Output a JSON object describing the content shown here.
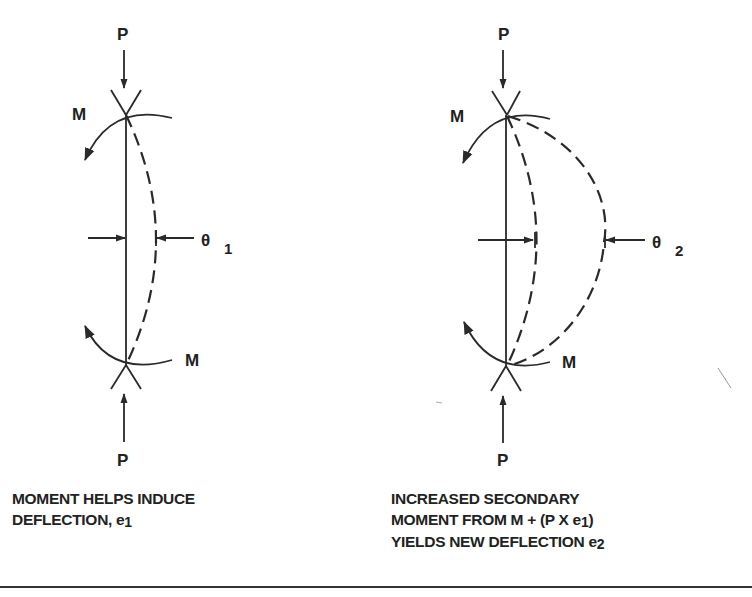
{
  "figure": {
    "left_panel": {
      "load_top_label": "P",
      "load_bottom_label": "P",
      "moment_top_label": "M",
      "moment_bottom_label": "M",
      "deflection_symbol": "θ",
      "deflection_subscript": "1",
      "caption_line1": "MOMENT HELPS INDUCE",
      "caption_line2_text": "DEFLECTION, e",
      "caption_line2_sub": "1"
    },
    "right_panel": {
      "load_top_label": "P",
      "load_bottom_label": "P",
      "moment_top_label": "M",
      "moment_bottom_label": "M",
      "deflection_symbol": "θ",
      "deflection_subscript": "2",
      "caption_line1": "INCREASED SECONDARY",
      "caption_line2_text": "MOMENT FROM M + (P X e",
      "caption_line2_sub": "1",
      "caption_line2_tail": ")",
      "caption_line3_text": "YIELDS NEW DEFLECTION e",
      "caption_line3_sub": "2"
    }
  }
}
